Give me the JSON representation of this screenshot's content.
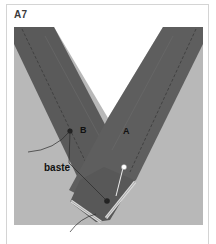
{
  "figure": {
    "label": "A7"
  },
  "illustration": {
    "labels": {
      "strip_b": "B",
      "strip_a": "A",
      "callout": "baste"
    },
    "colors": {
      "background": "#b8b8b8",
      "strip": "#5c5c5c",
      "strip_dark": "#4f4f4f",
      "stitch": "#3c3c3c",
      "edge_highlight": "#d9d9d9",
      "pin_head": "#ffffff",
      "leader_line": "#2a2a2a",
      "frame_border": "#d4d4d4"
    }
  }
}
